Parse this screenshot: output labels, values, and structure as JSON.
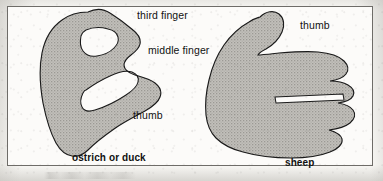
{
  "figure": {
    "frame": {
      "border_color": "#6e6c68",
      "background_color": "#fcfbf9"
    },
    "hand_fill_color": "#b9b7b2",
    "hand_outline_color": "#1a1a1a",
    "text_color": "#111111",
    "labels": {
      "third_finger": "third finger",
      "middle_finger": "middle finger",
      "thumb_left": "thumb",
      "thumb_right": "thumb"
    },
    "captions": {
      "left": "ostrich or duck",
      "right": "sheep"
    },
    "panels": [
      {
        "name": "ostrich-or-duck",
        "caption": "ostrich or duck",
        "labels": [
          "third finger",
          "middle finger",
          "thumb"
        ]
      },
      {
        "name": "sheep",
        "caption": "sheep",
        "labels": [
          "thumb"
        ]
      }
    ]
  }
}
